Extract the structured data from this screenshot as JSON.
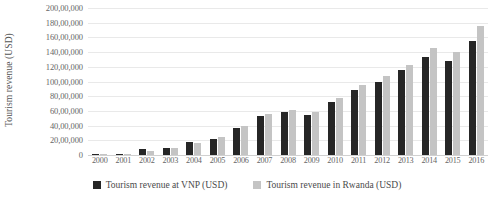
{
  "chart_data": {
    "type": "bar",
    "title": "",
    "xlabel": "",
    "ylabel": "Tourism revenue (USD)",
    "ylim": [
      0,
      20000000
    ],
    "ytick_labels": [
      "200,00,000",
      "180,00,000",
      "160,00,000",
      "140,00,000",
      "120,00,000",
      "100,00,000",
      "80,00,000",
      "60,00,000",
      "40,00,000",
      "20,00,000",
      "0"
    ],
    "ytick_values": [
      20000000,
      18000000,
      16000000,
      14000000,
      12000000,
      10000000,
      8000000,
      6000000,
      4000000,
      2000000,
      0
    ],
    "grid": true,
    "legend_position": "bottom",
    "categories": [
      "2000",
      "2001",
      "2002",
      "2003",
      "2004",
      "2005",
      "2006",
      "2007",
      "2008",
      "2009",
      "2010",
      "2011",
      "2012",
      "2013",
      "2014",
      "2015",
      "2016"
    ],
    "series": [
      {
        "name": "Tourism revenue at VNP (USD)",
        "color": "#262626",
        "values": [
          200000,
          200000,
          800000,
          1000000,
          1800000,
          2200000,
          3700000,
          5300000,
          5900000,
          5500000,
          7200000,
          8800000,
          10000000,
          11500000,
          13300000,
          12800000,
          15500000
        ]
      },
      {
        "name": "Tourism revenue in Rwanda (USD)",
        "color": "#c4c4c4",
        "values": [
          100000,
          100000,
          500000,
          1000000,
          1700000,
          2400000,
          4000000,
          5600000,
          6100000,
          5900000,
          7800000,
          9500000,
          10800000,
          12200000,
          14500000,
          14000000,
          17500000
        ]
      }
    ]
  }
}
